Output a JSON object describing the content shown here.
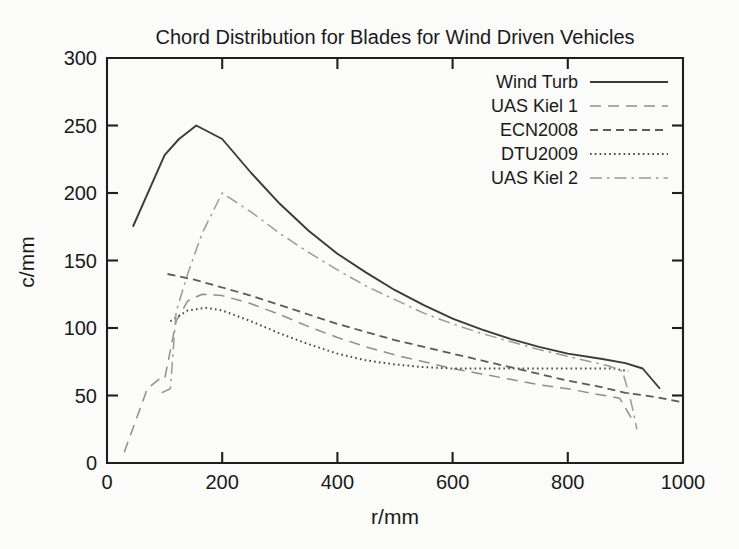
{
  "chart_data": {
    "type": "line",
    "title": "Chord Distribution for Blades for Wind Driven Vehicles",
    "xlabel": "r/mm",
    "ylabel": "c/mm",
    "xlim": [
      0,
      1000
    ],
    "ylim": [
      0,
      300
    ],
    "xticks": [
      0,
      200,
      400,
      600,
      800,
      1000
    ],
    "yticks": [
      0,
      50,
      100,
      150,
      200,
      250,
      300
    ],
    "grid": false,
    "legend_position": "top-right inside",
    "series": [
      {
        "name": "Wind Turb",
        "style": "solid",
        "color": "#3a3a3a",
        "points": [
          [
            45,
            175
          ],
          [
            100,
            228
          ],
          [
            125,
            240
          ],
          [
            155,
            250
          ],
          [
            200,
            240
          ],
          [
            250,
            215
          ],
          [
            300,
            192
          ],
          [
            350,
            172
          ],
          [
            400,
            155
          ],
          [
            450,
            141
          ],
          [
            500,
            128
          ],
          [
            550,
            117
          ],
          [
            600,
            107
          ],
          [
            650,
            99
          ],
          [
            700,
            92
          ],
          [
            750,
            86
          ],
          [
            800,
            81
          ],
          [
            860,
            77
          ],
          [
            900,
            74
          ],
          [
            930,
            70
          ],
          [
            960,
            55
          ]
        ]
      },
      {
        "name": "UAS Kiel 1",
        "style": "longdash",
        "color": "#8e8e8e",
        "points": [
          [
            30,
            8
          ],
          [
            70,
            55
          ],
          [
            90,
            62
          ],
          [
            100,
            62
          ],
          [
            120,
            105
          ],
          [
            140,
            120
          ],
          [
            165,
            125
          ],
          [
            200,
            124
          ],
          [
            250,
            118
          ],
          [
            300,
            110
          ],
          [
            350,
            101
          ],
          [
            400,
            93
          ],
          [
            450,
            86
          ],
          [
            500,
            80
          ],
          [
            550,
            75
          ],
          [
            600,
            70
          ],
          [
            650,
            66
          ],
          [
            700,
            62
          ],
          [
            750,
            58
          ],
          [
            800,
            55
          ],
          [
            850,
            51
          ],
          [
            890,
            48
          ],
          [
            915,
            30
          ]
        ]
      },
      {
        "name": "ECN2008",
        "style": "dash",
        "color": "#5a5a5a",
        "points": [
          [
            105,
            140
          ],
          [
            150,
            136
          ],
          [
            200,
            130
          ],
          [
            250,
            124
          ],
          [
            300,
            117
          ],
          [
            350,
            110
          ],
          [
            400,
            103
          ],
          [
            450,
            97
          ],
          [
            500,
            91
          ],
          [
            550,
            86
          ],
          [
            600,
            81
          ],
          [
            650,
            76
          ],
          [
            700,
            71
          ],
          [
            750,
            66
          ],
          [
            800,
            61
          ],
          [
            850,
            57
          ],
          [
            900,
            52
          ],
          [
            950,
            49
          ],
          [
            1000,
            45
          ]
        ]
      },
      {
        "name": "DTU2009",
        "style": "dot",
        "color": "#4a4a4a",
        "points": [
          [
            110,
            105
          ],
          [
            140,
            113
          ],
          [
            170,
            115
          ],
          [
            200,
            113
          ],
          [
            250,
            105
          ],
          [
            300,
            96
          ],
          [
            350,
            88
          ],
          [
            400,
            81
          ],
          [
            450,
            76
          ],
          [
            500,
            73
          ],
          [
            550,
            71
          ],
          [
            600,
            70
          ],
          [
            650,
            70
          ],
          [
            700,
            70
          ],
          [
            750,
            70
          ],
          [
            800,
            70
          ],
          [
            850,
            70
          ],
          [
            880,
            70
          ],
          [
            905,
            68
          ]
        ]
      },
      {
        "name": "UAS Kiel 2",
        "style": "dashdot",
        "color": "#9a9a9a",
        "points": [
          [
            95,
            52
          ],
          [
            110,
            55
          ],
          [
            120,
            112
          ],
          [
            140,
            140
          ],
          [
            165,
            170
          ],
          [
            200,
            200
          ],
          [
            250,
            186
          ],
          [
            300,
            170
          ],
          [
            350,
            156
          ],
          [
            400,
            143
          ],
          [
            450,
            131
          ],
          [
            500,
            121
          ],
          [
            550,
            111
          ],
          [
            600,
            103
          ],
          [
            650,
            96
          ],
          [
            700,
            90
          ],
          [
            750,
            84
          ],
          [
            800,
            79
          ],
          [
            840,
            75
          ],
          [
            870,
            72
          ],
          [
            895,
            68
          ],
          [
            910,
            45
          ],
          [
            920,
            25
          ]
        ]
      }
    ]
  },
  "axes": {
    "x_tick_labels": [
      "0",
      "200",
      "400",
      "600",
      "800",
      "1000"
    ],
    "y_tick_labels": [
      "0",
      "50",
      "100",
      "150",
      "200",
      "250",
      "300"
    ]
  },
  "legend": {
    "entries": [
      {
        "label": "Wind Turb"
      },
      {
        "label": "UAS Kiel 1"
      },
      {
        "label": "ECN2008"
      },
      {
        "label": "DTU2009"
      },
      {
        "label": "UAS Kiel 2"
      }
    ]
  }
}
